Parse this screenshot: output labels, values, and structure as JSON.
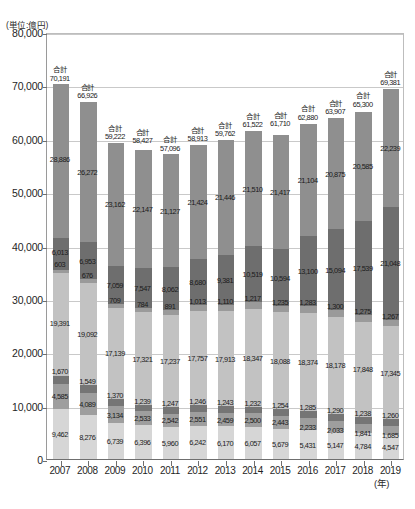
{
  "unit_note": "(単位:億円)",
  "x_axis_unit": "(年)",
  "total_prefix": "合計",
  "chart_data": {
    "type": "bar",
    "title": "",
    "xlabel": "(年)",
    "ylabel": "(単位:億円)",
    "stacked": true,
    "grid": true,
    "legend": "none",
    "ylim": [
      0,
      80000
    ],
    "yticks": [
      "0",
      "10,000",
      "20,000",
      "30,000",
      "40,000",
      "50,000",
      "60,000",
      "70,000",
      "80,000"
    ],
    "ytick_values": [
      0,
      10000,
      20000,
      30000,
      40000,
      50000,
      60000,
      70000,
      80000
    ],
    "categories": [
      "2007",
      "2008",
      "2009",
      "2010",
      "2011",
      "2012",
      "2013",
      "2014",
      "2015",
      "2016",
      "2017",
      "2018",
      "2019"
    ],
    "totals": [
      70191,
      66926,
      59222,
      58427,
      57096,
      58913,
      59762,
      61522,
      61710,
      62880,
      63907,
      65300,
      69381
    ],
    "totals_text": [
      "70,191",
      "66,926",
      "59,222",
      "58,427",
      "57,096",
      "58,913",
      "59,762",
      "61,522",
      "61,710",
      "62,880",
      "63,907",
      "65,300",
      "69,381"
    ],
    "series": [
      {
        "name": "series-1",
        "color": "#d6d6d6",
        "values": [
          9462,
          8276,
          6739,
          6396,
          5960,
          6242,
          6170,
          6057,
          5679,
          5431,
          5147,
          4784,
          4547
        ],
        "values_text": [
          "9,462",
          "8,276",
          "6,739",
          "6,396",
          "5,960",
          "6,242",
          "6,170",
          "6,057",
          "5,679",
          "5,431",
          "5,147",
          "4,784",
          "4,547"
        ]
      },
      {
        "name": "series-2",
        "color": "#9e9e9e",
        "values": [
          4585,
          4089,
          3134,
          2533,
          2542,
          2551,
          2459,
          2500,
          2443,
          2233,
          2033,
          1841,
          1685
        ],
        "values_text": [
          "4,585",
          "4,089",
          "3,134",
          "2,533",
          "2,542",
          "2,551",
          "2,459",
          "2,500",
          "2,443",
          "2,233",
          "2,033",
          "1,841",
          "1,685"
        ]
      },
      {
        "name": "series-3",
        "color": "#757575",
        "values": [
          1670,
          1549,
          1370,
          1239,
          1247,
          1246,
          1243,
          1232,
          1254,
          1285,
          1290,
          1238,
          1260
        ],
        "values_text": [
          "1,670",
          "1,549",
          "1,370",
          "1,239",
          "1,247",
          "1,246",
          "1,243",
          "1,232",
          "1,254",
          "1,285",
          "1,290",
          "1,238",
          "1,260"
        ]
      },
      {
        "name": "series-4",
        "color": "#c2c2c2",
        "values": [
          19391,
          19092,
          17139,
          17321,
          17237,
          17757,
          17913,
          18347,
          18088,
          18374,
          18178,
          17848,
          17345
        ],
        "values_text": [
          "19,391",
          "19,092",
          "17,139",
          "17,321",
          "17,237",
          "17,757",
          "17,913",
          "18,347",
          "18,088",
          "18,374",
          "18,178",
          "17,848",
          "17,345"
        ]
      },
      {
        "name": "series-5",
        "color": "#9a9a9a",
        "values": [
          603,
          676,
          709,
          784,
          891,
          1013,
          1110,
          1217,
          1235,
          1283,
          1300,
          1275,
          1267
        ],
        "values_text": [
          "603",
          "676",
          "709",
          "784",
          "891",
          "1,013",
          "1,110",
          "1,217",
          "1,235",
          "1,283",
          "1,300",
          "1,275",
          "1,267"
        ]
      },
      {
        "name": "series-6",
        "color": "#6e6e6e",
        "values": [
          6013,
          6953,
          7059,
          7547,
          8062,
          8680,
          9381,
          10519,
          10594,
          13100,
          15094,
          17539,
          21048
        ],
        "values_text": [
          "6,013",
          "6,953",
          "7,059",
          "7,547",
          "8,062",
          "8,680",
          "9,381",
          "10,519",
          "10,594",
          "13,100",
          "15,094",
          "17,539",
          "21,048"
        ]
      },
      {
        "name": "series-7",
        "color": "#8f8f8f",
        "values": [
          28886,
          26272,
          23162,
          22147,
          21127,
          21424,
          21446,
          21510,
          21417,
          21104,
          20875,
          20585,
          22239
        ],
        "values_text": [
          "28,886",
          "26,272",
          "23,162",
          "22,147",
          "21,127",
          "21,424",
          "21,446",
          "21,510",
          "21,417",
          "21,104",
          "20,875",
          "20,585",
          "22,239"
        ]
      }
    ]
  }
}
